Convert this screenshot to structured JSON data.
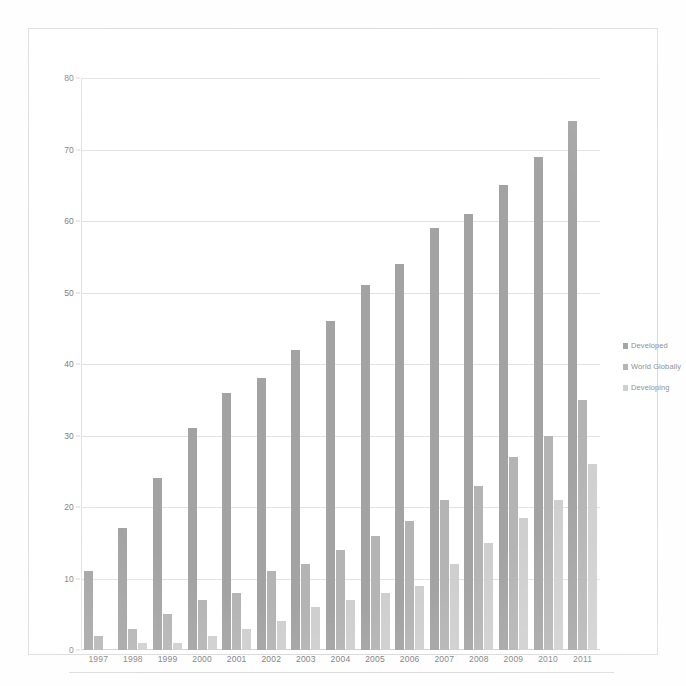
{
  "chart_data": {
    "type": "bar",
    "title": "",
    "subtitle": "",
    "xlabel": "",
    "ylabel": "",
    "ylim": [
      0,
      80
    ],
    "yticks": [
      0,
      10,
      20,
      30,
      40,
      50,
      60,
      70,
      80
    ],
    "grid": true,
    "legend_position": "right",
    "categories": [
      "1997",
      "1998",
      "1999",
      "2000",
      "2001",
      "2002",
      "2003",
      "2004",
      "2005",
      "2006",
      "2007",
      "2008",
      "2009",
      "2010",
      "2011"
    ],
    "series": [
      {
        "name": "Developed",
        "color": "#a3a3a3",
        "values": [
          11,
          17,
          24,
          31,
          36,
          38,
          42,
          46,
          51,
          54,
          59,
          61,
          65,
          69,
          74
        ]
      },
      {
        "name": "World Globally",
        "color": "#b4b4b4",
        "values": [
          2,
          3,
          5,
          7,
          8,
          11,
          12,
          14,
          16,
          18,
          21,
          23,
          27,
          30,
          35
        ]
      },
      {
        "name": "Developing",
        "color": "#cfcfcf",
        "values": [
          0,
          1,
          1,
          2,
          3,
          4,
          6,
          7,
          8,
          9,
          12,
          15,
          18.5,
          21,
          26
        ]
      }
    ]
  },
  "legend": {
    "items": [
      {
        "label": "Developed",
        "color": "#a3a3a3"
      },
      {
        "label": "World Globally",
        "color": "#b4b4b4"
      },
      {
        "label": "Developing",
        "color": "#cfcfcf"
      }
    ]
  }
}
